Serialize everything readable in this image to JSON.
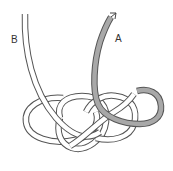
{
  "diagram": {
    "type": "knot-illustration",
    "labels": {
      "end_a": "A",
      "end_b": "B"
    },
    "colors": {
      "rope_fill": "#ffffff",
      "rope_outline": "#555555",
      "working_end_fill": "#a8a8a8",
      "background": "#ffffff"
    },
    "elements": [
      {
        "name": "rope-end-b",
        "label": "B",
        "description": "standing end entering from top-left"
      },
      {
        "name": "rope-end-a",
        "label": "A",
        "description": "grey working end with arrow pointing up-right"
      },
      {
        "name": "knot-body",
        "description": "interwoven loops forming knot at bottom"
      }
    ]
  }
}
